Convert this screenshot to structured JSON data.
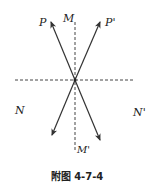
{
  "diagram": {
    "caption": "附图 4-7-4",
    "labels": {
      "P": "P",
      "P_prime": "P'",
      "M": "M",
      "M_prime": "M'",
      "N": "N",
      "N_prime": "N'"
    },
    "center": {
      "x": 75,
      "y": 80
    },
    "lines": {
      "vertical_dashed": {
        "from": [
          75,
          22
        ],
        "to": [
          75,
          150
        ],
        "label_top": "M",
        "label_bottom": "M'"
      },
      "horizontal_dashed": {
        "from": [
          15,
          80
        ],
        "to": [
          135,
          80
        ],
        "label_left": "N",
        "label_right": "N'"
      }
    },
    "arrows": [
      {
        "name": "arrow-to-P",
        "from": [
          75,
          80
        ],
        "to": [
          51,
          22
        ],
        "label": "P"
      },
      {
        "name": "arrow-to-P-prime",
        "from": [
          75,
          80
        ],
        "to": [
          100,
          22
        ],
        "label": "P'"
      },
      {
        "name": "arrow-lower-left",
        "from": [
          75,
          80
        ],
        "to": [
          52,
          135
        ]
      },
      {
        "name": "arrow-lower-right",
        "from": [
          75,
          80
        ],
        "to": [
          100,
          140
        ]
      }
    ],
    "colors": {
      "line": "#333333",
      "background": "#ffffff"
    }
  }
}
